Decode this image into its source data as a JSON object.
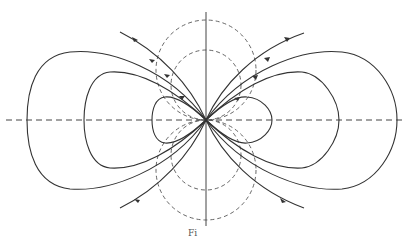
{
  "figure": {
    "caption": "Fi",
    "stroke_color": "#333333",
    "dash_color": "#555555",
    "center": [
      206,
      120
    ],
    "axes": {
      "horizontal_dashed": true,
      "vertical_solid": true
    },
    "solid_loops": {
      "left": [
        {
          "extent_x": 27,
          "half_height": 68
        },
        {
          "extent_x": 84,
          "half_height": 48
        },
        {
          "extent_x": 152,
          "half_height": 24
        }
      ],
      "right": [
        {
          "extent_x": 397,
          "half_height": 68
        },
        {
          "extent_x": 339,
          "half_height": 48
        },
        {
          "extent_x": 272,
          "half_height": 24
        }
      ]
    },
    "open_lines": [
      {
        "from": [
          120,
          32
        ],
        "to": [
          206,
          120
        ]
      },
      {
        "from": [
          206,
          120
        ],
        "to": [
          304,
          33
        ]
      },
      {
        "from": [
          120,
          208
        ],
        "to": [
          206,
          120
        ]
      },
      {
        "from": [
          206,
          120
        ],
        "to": [
          304,
          208
        ]
      }
    ],
    "dashed_circles": [
      {
        "cx": 206,
        "cy": 70,
        "r": 50
      },
      {
        "cx": 206,
        "cy": 85,
        "r": 35
      },
      {
        "cx": 206,
        "cy": 170,
        "r": 50
      },
      {
        "cx": 206,
        "cy": 155,
        "r": 35
      }
    ]
  }
}
